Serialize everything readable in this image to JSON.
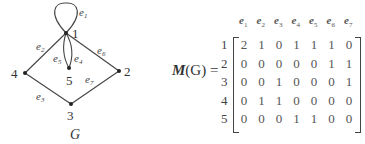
{
  "graph": {
    "name": "G",
    "nodes": [
      {
        "id": "1",
        "x": 66,
        "y": 33
      },
      {
        "id": "2",
        "x": 119,
        "y": 71
      },
      {
        "id": "3",
        "x": 71,
        "y": 104
      },
      {
        "id": "4",
        "x": 25,
        "y": 73
      },
      {
        "id": "5",
        "x": 69,
        "y": 68
      }
    ],
    "edges": [
      {
        "id": "e1",
        "from": "1",
        "to": "1",
        "type": "loop"
      },
      {
        "id": "e2",
        "from": "1",
        "to": "4"
      },
      {
        "id": "e3",
        "from": "4",
        "to": "3"
      },
      {
        "id": "e4",
        "from": "1",
        "to": "5"
      },
      {
        "id": "e5",
        "from": "1",
        "to": "5"
      },
      {
        "id": "e6",
        "from": "1",
        "to": "2"
      },
      {
        "id": "e7",
        "from": "3",
        "to": "2"
      }
    ]
  },
  "matrix": {
    "label_bold": "M",
    "label_rest": "(G) =",
    "arg": "G",
    "columns": [
      "e1",
      "e2",
      "e3",
      "e4",
      "e5",
      "e6",
      "e7"
    ],
    "rows": [
      "1",
      "2",
      "3",
      "4",
      "5"
    ],
    "values": [
      [
        2,
        1,
        0,
        1,
        1,
        1,
        0
      ],
      [
        0,
        0,
        0,
        0,
        0,
        1,
        1
      ],
      [
        0,
        0,
        1,
        0,
        0,
        0,
        1
      ],
      [
        0,
        1,
        1,
        0,
        0,
        0,
        0
      ],
      [
        0,
        0,
        0,
        1,
        1,
        0,
        0
      ]
    ]
  }
}
